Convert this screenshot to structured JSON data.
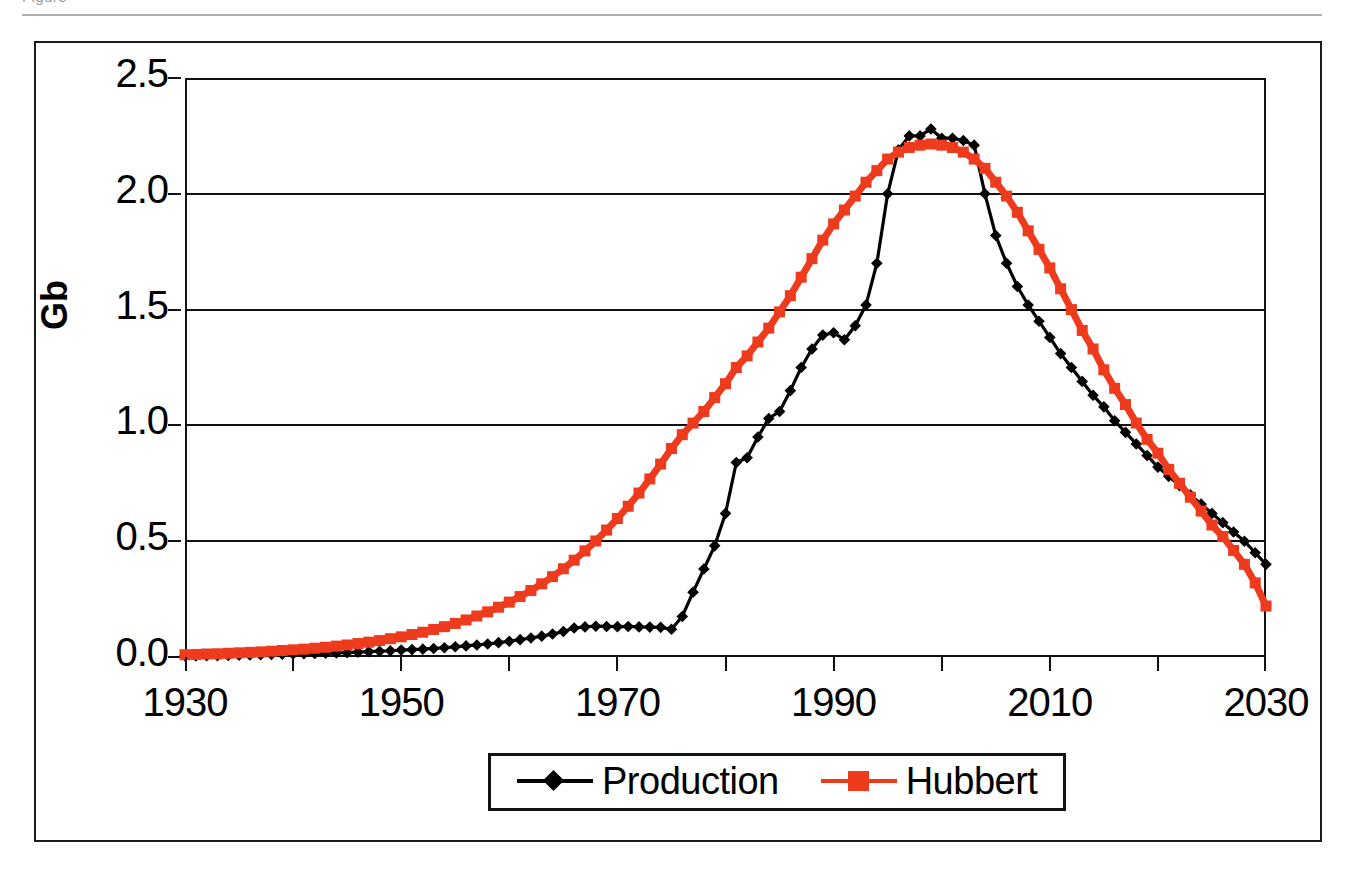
{
  "header": {
    "cropped_text": "Figure",
    "rule": "horizontal-rule"
  },
  "legend": {
    "position": "bottom-center",
    "items": [
      {
        "label": "Production",
        "color": "#000000",
        "marker": "diamond"
      },
      {
        "label": "Hubbert",
        "color": "#EE3B1E",
        "marker": "square"
      }
    ]
  },
  "colors": {
    "production": "#000000",
    "hubbert": "#EE3B1E",
    "axis": "#111111",
    "frame": "#1b1b1b"
  },
  "chart_data": {
    "type": "line",
    "title": "",
    "xlabel": "",
    "ylabel": "Gb",
    "xlim": [
      1930,
      2030
    ],
    "ylim": [
      0.0,
      2.5
    ],
    "grid": true,
    "y_ticks": [
      "0.0",
      "0.5",
      "1.0",
      "1.5",
      "2.0",
      "2.5"
    ],
    "y_tick_values": [
      0.0,
      0.5,
      1.0,
      1.5,
      2.0,
      2.5
    ],
    "x_ticks": [
      "1930",
      "1950",
      "1970",
      "1990",
      "2010",
      "2030"
    ],
    "x_tick_values": [
      1930,
      1950,
      1970,
      1990,
      2010,
      2030
    ],
    "x_minor_tick_values": [
      1940,
      1960,
      1980,
      2000,
      2020
    ],
    "x": [
      1930,
      1931,
      1932,
      1933,
      1934,
      1935,
      1936,
      1937,
      1938,
      1939,
      1940,
      1941,
      1942,
      1943,
      1944,
      1945,
      1946,
      1947,
      1948,
      1949,
      1950,
      1951,
      1952,
      1953,
      1954,
      1955,
      1956,
      1957,
      1958,
      1959,
      1960,
      1961,
      1962,
      1963,
      1964,
      1965,
      1966,
      1967,
      1968,
      1969,
      1970,
      1971,
      1972,
      1973,
      1974,
      1975,
      1976,
      1977,
      1978,
      1979,
      1980,
      1981,
      1982,
      1983,
      1984,
      1985,
      1986,
      1987,
      1988,
      1989,
      1990,
      1991,
      1992,
      1993,
      1994,
      1995,
      1996,
      1997,
      1998,
      1999,
      2000,
      2001,
      2002,
      2003,
      2004,
      2005,
      2006,
      2007,
      2008,
      2009,
      2010,
      2011,
      2012,
      2013,
      2014,
      2015,
      2016,
      2017,
      2018,
      2019,
      2020,
      2021,
      2022,
      2023,
      2024,
      2025,
      2026,
      2027,
      2028,
      2029,
      2030
    ],
    "series": [
      {
        "name": "Production",
        "color": "#000000",
        "marker": "diamond",
        "values": [
          0.005,
          0.005,
          0.006,
          0.006,
          0.007,
          0.008,
          0.009,
          0.01,
          0.011,
          0.012,
          0.013,
          0.014,
          0.015,
          0.016,
          0.018,
          0.019,
          0.021,
          0.023,
          0.025,
          0.027,
          0.03,
          0.032,
          0.034,
          0.037,
          0.04,
          0.044,
          0.048,
          0.052,
          0.056,
          0.062,
          0.068,
          0.075,
          0.082,
          0.09,
          0.099,
          0.11,
          0.125,
          0.13,
          0.133,
          0.132,
          0.131,
          0.132,
          0.13,
          0.129,
          0.128,
          0.12,
          0.175,
          0.28,
          0.38,
          0.48,
          0.62,
          0.84,
          0.86,
          0.95,
          1.03,
          1.06,
          1.15,
          1.25,
          1.33,
          1.39,
          1.4,
          1.37,
          1.43,
          1.52,
          1.7,
          2.0,
          2.19,
          2.25,
          2.25,
          2.28,
          2.24,
          2.24,
          2.23,
          2.21,
          2.0,
          1.82,
          1.7,
          1.6,
          1.52,
          1.45,
          1.38,
          1.31,
          1.25,
          1.19,
          1.13,
          1.08,
          1.02,
          0.97,
          0.92,
          0.87,
          0.82,
          0.78,
          0.74,
          0.7,
          0.66,
          0.62,
          0.58,
          0.54,
          0.5,
          0.45,
          0.4
        ]
      },
      {
        "name": "Hubbert",
        "color": "#EE3B1E",
        "marker": "square",
        "values": [
          0.01,
          0.011,
          0.013,
          0.014,
          0.016,
          0.018,
          0.02,
          0.022,
          0.025,
          0.028,
          0.031,
          0.034,
          0.038,
          0.042,
          0.047,
          0.052,
          0.058,
          0.064,
          0.071,
          0.079,
          0.087,
          0.097,
          0.107,
          0.119,
          0.131,
          0.145,
          0.16,
          0.177,
          0.195,
          0.215,
          0.237,
          0.261,
          0.287,
          0.316,
          0.347,
          0.381,
          0.418,
          0.458,
          0.501,
          0.548,
          0.598,
          0.651,
          0.708,
          0.769,
          0.833,
          0.9,
          0.96,
          1.01,
          1.06,
          1.12,
          1.18,
          1.25,
          1.3,
          1.36,
          1.42,
          1.49,
          1.56,
          1.64,
          1.72,
          1.8,
          1.87,
          1.93,
          1.99,
          2.05,
          2.1,
          2.15,
          2.18,
          2.2,
          2.21,
          2.215,
          2.21,
          2.2,
          2.18,
          2.15,
          2.11,
          2.05,
          1.99,
          1.92,
          1.84,
          1.76,
          1.68,
          1.59,
          1.5,
          1.41,
          1.33,
          1.24,
          1.16,
          1.09,
          1.01,
          0.94,
          0.88,
          0.81,
          0.75,
          0.69,
          0.63,
          0.57,
          0.52,
          0.46,
          0.4,
          0.32,
          0.22
        ]
      }
    ]
  }
}
